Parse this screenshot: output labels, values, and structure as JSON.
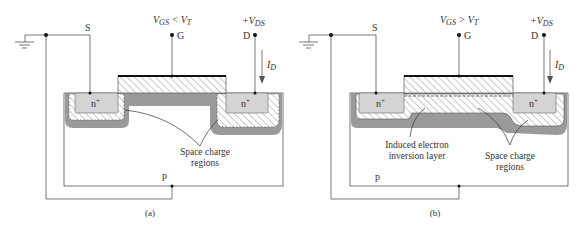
{
  "figure": {
    "panels": [
      {
        "id": "a",
        "caption": "(a)",
        "source_label": "S",
        "gate_label": "G",
        "drain_label": "D",
        "gate_condition": {
          "main": "V",
          "sub1": "GS",
          "op": " < V",
          "sub2": "T"
        },
        "drain_voltage": {
          "main": "+V",
          "sub": "DS"
        },
        "current": {
          "main": "I",
          "sub": "D"
        },
        "n_region_label": "n",
        "n_region_sup": "+",
        "substrate_label": "p",
        "annotations": [
          {
            "lines": [
              "Space charge",
              "regions"
            ]
          }
        ]
      },
      {
        "id": "b",
        "caption": "(b)",
        "source_label": "S",
        "gate_label": "G",
        "drain_label": "D",
        "gate_condition": {
          "main": "V",
          "sub1": "GS",
          "op": " > V",
          "sub2": "T"
        },
        "drain_voltage": {
          "main": "+V",
          "sub": "DS"
        },
        "current": {
          "main": "I",
          "sub": "D"
        },
        "n_region_label": "n",
        "n_region_sup": "+",
        "substrate_label": "p",
        "annotations": [
          {
            "lines": [
              "Induced electron",
              "inversion layer"
            ]
          },
          {
            "lines": [
              "Space charge",
              "regions"
            ]
          }
        ]
      }
    ],
    "colors": {
      "line": "#444444",
      "depletion": "#9a9a9a",
      "n_region": "#d4d4d4",
      "hatch": "#666666",
      "gate_metal": "#111111"
    }
  }
}
